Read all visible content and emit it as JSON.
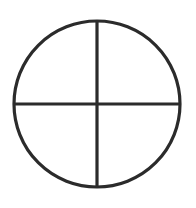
{
  "canvas": {
    "width": 196,
    "height": 208,
    "background_color": "#ffffff"
  },
  "icon": {
    "name": "crosshair-reticle-icon",
    "title": "Crosshair reticle",
    "style": "line-art outline",
    "stroke_color": "#2b2b2b",
    "fill_color": "none",
    "stroke_width": 3.2
  },
  "geometry": {
    "center_x": 97,
    "center_y": 104,
    "radius": 83,
    "circle": {
      "name": "outer-circle",
      "cx": 97,
      "cy": 104,
      "r": 83,
      "top_y": 21,
      "bottom_y": 187,
      "left_x": 14,
      "right_x": 180
    },
    "vertical_line": {
      "name": "vertical-crosshair-line",
      "x": 97,
      "y1": 21,
      "y2": 187
    },
    "horizontal_line": {
      "name": "horizontal-crosshair-line",
      "y": 104,
      "x1": 14,
      "x2": 180
    }
  },
  "labels": {
    "alt_text": "Circle divided into four quadrants by a vertical and a horizontal diameter"
  }
}
